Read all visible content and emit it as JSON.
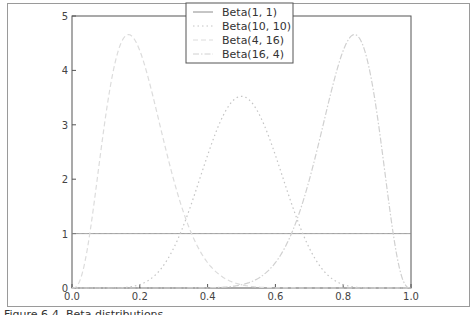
{
  "figure": {
    "caption": "Figure 6-4. Beta distributions"
  },
  "colors": {
    "axis": "#555555",
    "beta_1_1": "#8c8c8c",
    "beta_10_10": "#c8c8c8",
    "beta_4_16": "#dddddd",
    "beta_16_4": "#d2d2d2"
  },
  "legend": {
    "items": [
      {
        "label": "Beta(1, 1)",
        "style": "solid"
      },
      {
        "label": "Beta(10, 10)",
        "style": "dotted"
      },
      {
        "label": "Beta(4, 16)",
        "style": "dashed"
      },
      {
        "label": "Beta(16, 4)",
        "style": "dashdot"
      }
    ]
  },
  "axes": {
    "x_ticks": [
      "0.0",
      "0.2",
      "0.4",
      "0.6",
      "0.8",
      "1.0"
    ],
    "y_ticks": [
      "0",
      "1",
      "2",
      "3",
      "4",
      "5"
    ]
  },
  "chart_data": {
    "type": "line",
    "title": "",
    "xlabel": "",
    "ylabel": "",
    "xlim": [
      0,
      1
    ],
    "ylim": [
      0,
      5
    ],
    "grid": false,
    "legend_position": "upper center",
    "x": [
      0.0,
      0.05,
      0.1,
      0.15,
      0.2,
      0.25,
      0.3,
      0.35,
      0.4,
      0.45,
      0.5,
      0.55,
      0.6,
      0.65,
      0.7,
      0.75,
      0.8,
      0.85,
      0.9,
      0.95,
      1.0
    ],
    "series": [
      {
        "name": "Beta(1, 1)",
        "values": [
          1,
          1,
          1,
          1,
          1,
          1,
          1,
          1,
          1,
          1,
          1,
          1,
          1,
          1,
          1,
          1,
          1,
          1,
          1,
          1,
          1
        ]
      },
      {
        "name": "Beta(10, 10)",
        "values": [
          0,
          0.0,
          0.0,
          0.01,
          0.06,
          0.29,
          0.76,
          1.52,
          2.42,
          3.16,
          3.52,
          3.16,
          2.42,
          1.52,
          0.76,
          0.29,
          0.06,
          0.01,
          0.0,
          0.0,
          0
        ]
      },
      {
        "name": "Beta(4, 16)",
        "values": [
          0,
          1.35,
          3.5,
          4.52,
          4.36,
          3.39,
          2.23,
          1.26,
          0.61,
          0.26,
          0.09,
          0.03,
          0.01,
          0.0,
          0.0,
          0.0,
          0.0,
          0.0,
          0.0,
          0.0,
          0
        ]
      },
      {
        "name": "Beta(16, 4)",
        "values": [
          0,
          0.0,
          0.0,
          0.0,
          0.0,
          0.0,
          0.0,
          0.0,
          0.01,
          0.03,
          0.09,
          0.26,
          0.61,
          1.26,
          2.23,
          3.39,
          4.36,
          4.52,
          3.5,
          1.35,
          0
        ]
      }
    ]
  }
}
